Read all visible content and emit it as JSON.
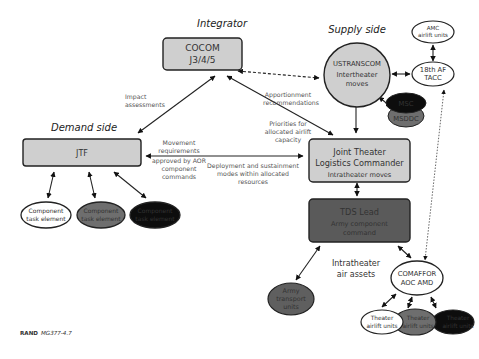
{
  "sections": {
    "integrator": "Integrator",
    "supply": "Supply side",
    "demand": "Demand side"
  },
  "nodes": {
    "cocom": {
      "line1": "COCOM",
      "line2": "J3/4/5"
    },
    "jtf": {
      "label": "JTF"
    },
    "ustranscom": {
      "line1": "USTRANSCOM",
      "line2": "Intertheater",
      "line3": "moves"
    },
    "amc": {
      "line1": "AMC",
      "line2": "airlift units"
    },
    "tacc": {
      "line1": "18th AF",
      "line2": "TACC"
    },
    "msc": {
      "label": "MSC"
    },
    "msddc": {
      "label": "MSDDC"
    },
    "jtlc": {
      "line1": "Joint Theater",
      "line2": "Logistics Commander",
      "line3": "Intratheater moves"
    },
    "tds": {
      "line1": "TDS Lead",
      "line2": "Army component",
      "line3": "command"
    },
    "comaffor": {
      "line1": "COMAFFOR",
      "line2": "AOC AMD"
    },
    "army_transport": {
      "line1": "Army",
      "line2": "transport",
      "line3": "units"
    },
    "component_tasks": [
      {
        "line1": "Component",
        "line2": "task element",
        "fill": "#ffffff",
        "text": "#333333"
      },
      {
        "line1": "Component",
        "line2": "task element",
        "fill": "#6e6e6e",
        "text": "#e8e8e8"
      },
      {
        "line1": "Component",
        "line2": "task element",
        "fill": "#0d0d0d",
        "text": "#ffffff"
      }
    ],
    "theater_airlift": [
      {
        "line1": "Theater",
        "line2": "airlift units",
        "fill": "#ffffff",
        "text": "#333333"
      },
      {
        "line1": "Theater",
        "line2": "airlift units",
        "fill": "#6e6e6e",
        "text": "#e8e8e8"
      },
      {
        "line1": "Theater",
        "line2": "airlift units",
        "fill": "#0d0d0d",
        "text": "#ffffff"
      }
    ]
  },
  "edge_labels": {
    "impact": {
      "line1": "Impact",
      "line2": "assessments"
    },
    "apportionment": {
      "line1": "Apportionment",
      "line2": "recommendations"
    },
    "priorities": {
      "line1": "Priorities for",
      "line2": "allocated airlift",
      "line3": "capacity"
    },
    "movement": {
      "line1": "Movement",
      "line2": "requirements",
      "line3": "approved by AOR",
      "line4": "component",
      "line5": "commands"
    },
    "deployment": {
      "line1": "Deployment and sustainment",
      "line2": "modes within allocated",
      "line3": "resources"
    },
    "intratheater_air": {
      "line1": "Intratheater",
      "line2": "air assets"
    }
  },
  "footer": {
    "org": "RAND",
    "id": "MG377-4.7"
  },
  "colors": {
    "light_gray": "#cfcfcf",
    "dark_gray": "#5a5a5a",
    "mid_gray": "#6e6e6e",
    "black": "#0d0d0d",
    "stroke": "#222222"
  }
}
